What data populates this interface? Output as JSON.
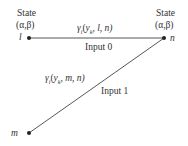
{
  "diagram": {
    "nodes": [
      {
        "id": "l",
        "label": "l",
        "state_title": "State",
        "state_params": "(α,β)",
        "x": 29,
        "y": 38
      },
      {
        "id": "n",
        "label": "n",
        "state_title": "State",
        "state_params": "(α,β)",
        "x": 164,
        "y": 38
      },
      {
        "id": "m",
        "label": "m",
        "x": 29,
        "y": 133
      }
    ],
    "edges": [
      {
        "from": "l",
        "to": "n",
        "metric": "γi(yk, l, n)",
        "metric_parts": {
          "gamma": "γ",
          "sub_i": "i",
          "open": "(",
          "y": "y",
          "sub_k": "k",
          "rest": ", l, n)"
        },
        "input_label": "Input 0"
      },
      {
        "from": "m",
        "to": "n",
        "metric": "γi(yk, m, n)",
        "metric_parts": {
          "gamma": "γ",
          "sub_i": "i",
          "open": "(",
          "y": "y",
          "sub_k": "k",
          "rest": ", m, n)"
        },
        "input_label": "Input 1"
      }
    ],
    "colors": {
      "line": "#444444",
      "text": "#333333",
      "node": "#222222"
    }
  }
}
